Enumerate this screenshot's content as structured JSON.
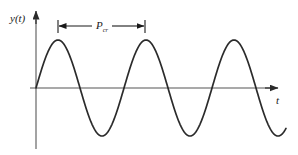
{
  "figure": {
    "type": "sinusoidal-waveform-diagram",
    "background_color": "#ffffff",
    "curve_color": "#2b2b2b",
    "axis_color": "#8c8c8c",
    "dimension_color": "#1a1a1a",
    "labels": {
      "y_axis": "y(t)",
      "x_axis": "t",
      "period_symbol": "P",
      "period_subscript": "cr"
    }
  },
  "chart_data": {
    "type": "line",
    "title": "",
    "xlabel": "t",
    "ylabel": "y(t)",
    "grid": false,
    "legend": null,
    "annotations": [
      {
        "name": "period-dimension",
        "text": "P_cr",
        "symbol": "P",
        "subscript": "cr",
        "from_t": 0,
        "to_t": 1,
        "meaning": "critical period - one full oscillation cycle"
      }
    ],
    "waveform": {
      "form": "sine",
      "amplitude": 1.0,
      "period_px": 88,
      "phase": 0,
      "cycles_shown": 2.85,
      "zero_line_y": 0
    },
    "x": [
      0,
      0.25,
      0.5,
      0.75,
      1.0,
      1.25,
      1.5,
      1.75,
      2.0,
      2.25,
      2.5,
      2.75
    ],
    "y": [
      0,
      1.0,
      0,
      -1.0,
      0,
      1.0,
      0,
      -1.0,
      0,
      1.0,
      0,
      -1.0
    ],
    "xlim": [
      0,
      2.85
    ],
    "ylim": [
      -1.15,
      1.15
    ],
    "peaks_px": [
      [
        58,
        40
      ],
      [
        145,
        40
      ],
      [
        233,
        40
      ]
    ],
    "troughs_px": [
      [
        101,
        138
      ],
      [
        189,
        138
      ]
    ],
    "zero_crossings_px": [
      36,
      80,
      123,
      167,
      211,
      255
    ],
    "curve_start_px": [
      36,
      88
    ],
    "curve_end_px": [
      286,
      137
    ]
  },
  "geometry": {
    "y_axis": {
      "x": 36,
      "top_y": 12,
      "bottom_y": 149
    },
    "x_axis": {
      "y": 88,
      "left_x": 30,
      "right_x": 278
    },
    "dimension_line": {
      "y": 26,
      "left_x": 58,
      "right_x": 145,
      "tick_half_height": 6
    },
    "y_label_pos": [
      10,
      21
    ],
    "x_label_pos": [
      277,
      103
    ],
    "period_label_pos": [
      96,
      26
    ]
  }
}
